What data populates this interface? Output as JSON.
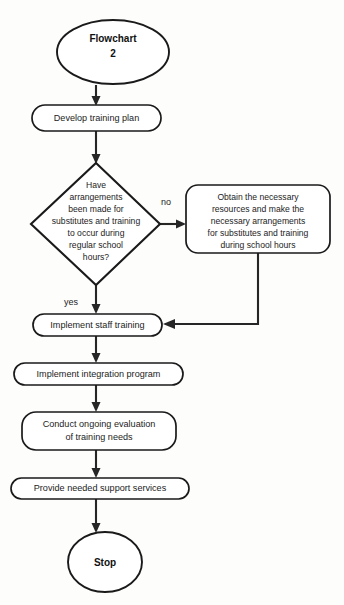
{
  "diagram": {
    "title": "Flowchart 2",
    "type": "flowchart",
    "background_color": "#fdfdfc",
    "line_color": "#262626",
    "text_color": "#1c1c1c"
  },
  "nodes": {
    "start": {
      "shape": "ellipse",
      "line1": "Flowchart",
      "line2": "2"
    },
    "develop_plan": {
      "shape": "rounded-rect",
      "line1": "Develop training plan"
    },
    "decision": {
      "shape": "diamond",
      "line1": "Have",
      "line2": "arrangements",
      "line3": "been made for",
      "line4": "substitutes and training",
      "line5": "to occur during",
      "line6": "regular school",
      "line7": "hours?"
    },
    "obtain_resources": {
      "shape": "rounded-rect",
      "line1": "Obtain the necessary",
      "line2": "resources and make the",
      "line3": "necessary arrangements",
      "line4": "for substitutes and training",
      "line5": "during school hours"
    },
    "implement_staff_training": {
      "shape": "rounded-rect",
      "line1": "Implement staff training"
    },
    "implement_integration": {
      "shape": "rounded-rect",
      "line1": "Implement integration program"
    },
    "conduct_evaluation": {
      "shape": "rounded-rect",
      "line1": "Conduct ongoing evaluation",
      "line2": "of training needs"
    },
    "provide_support": {
      "shape": "rounded-rect",
      "line1": "Provide needed support services"
    },
    "stop": {
      "shape": "ellipse",
      "line1": "Stop"
    }
  },
  "edge_labels": {
    "no": "no",
    "yes": "yes"
  }
}
